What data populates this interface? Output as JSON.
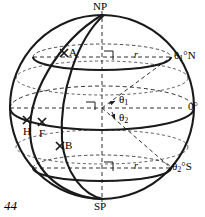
{
  "figure": {
    "kind": "sphere-latitude-diagram",
    "page_number": "44",
    "stroke_color": "#1a1a1a",
    "background_color": "#ffffff"
  },
  "poles": {
    "north_label": "NP",
    "south_label": "SP"
  },
  "latitudes": [
    {
      "id": "north-parallel",
      "label_main": "θ",
      "label_sub": "1",
      "label_suffix": "°N"
    },
    {
      "id": "equator",
      "label_main": "",
      "label_sub": "",
      "label_suffix": "0°"
    },
    {
      "id": "south-parallel",
      "label_main": "θ",
      "label_sub": "2",
      "label_suffix": "°S"
    }
  ],
  "labels": {
    "north_parallel": {
      "base": "θ",
      "sub": "1",
      "suffix": "°N"
    },
    "equator": {
      "text": "0°"
    },
    "south_parallel": {
      "base": "θ",
      "sub": "2",
      "suffix": "°S"
    }
  },
  "angles": [
    {
      "id": "theta-1",
      "base": "θ",
      "sub": "1"
    },
    {
      "id": "theta-2",
      "base": "θ",
      "sub": "2"
    }
  ],
  "radii": [
    {
      "id": "r-north",
      "text": "r"
    },
    {
      "id": "r-south",
      "text": "r"
    }
  ],
  "points": [
    {
      "id": "point-a",
      "label": "A",
      "marker": "cross"
    },
    {
      "id": "point-h",
      "label": "H",
      "marker": "cross"
    },
    {
      "id": "point-f",
      "label": "F",
      "marker": "cross"
    },
    {
      "id": "point-b",
      "label": "B",
      "marker": "cross"
    }
  ],
  "point_labels": {
    "a": "A",
    "h": "H",
    "f": "F",
    "b": "B"
  }
}
